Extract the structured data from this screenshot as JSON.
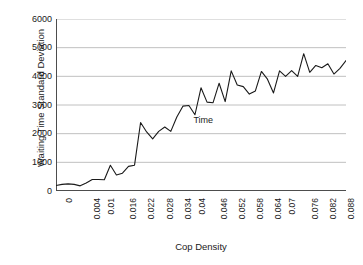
{
  "chart_data": {
    "type": "line",
    "title": "",
    "xlabel": "Cop Density",
    "ylabel": "Waiting Time Standard Deviation",
    "xlim": [
      0,
      0.096
    ],
    "ylim": [
      0,
      6000
    ],
    "grid": true,
    "grid_axis": "y",
    "legend_position": "inline-annotation",
    "annotations": [
      {
        "text": "Time",
        "x": 0.0455,
        "y": 2480
      }
    ],
    "ytick_labels": [
      "0",
      "1000",
      "2000",
      "3000",
      "4000",
      "5000",
      "6000"
    ],
    "ytick_values": [
      0,
      1000,
      2000,
      3000,
      4000,
      5000,
      6000
    ],
    "xtick_labels": [
      "0",
      "0.004",
      "0.01",
      "0.016",
      "0.022",
      "0.028",
      "0.034",
      "0.04",
      "0.046",
      "0.052",
      "0.058",
      "0.064",
      "0.07",
      "0.076",
      "0.082",
      "0.088",
      "0.094"
    ],
    "xtick_values": [
      0,
      0.004,
      0.01,
      0.016,
      0.022,
      0.028,
      0.034,
      0.04,
      0.046,
      0.052,
      0.058,
      0.064,
      0.07,
      0.076,
      0.082,
      0.088,
      0.094
    ],
    "xtick_minor_step": 0.002,
    "series": [
      {
        "name": "Time",
        "color": "#1a1a1a",
        "x": [
          0.0,
          0.002,
          0.004,
          0.006,
          0.008,
          0.01,
          0.012,
          0.014,
          0.016,
          0.018,
          0.02,
          0.022,
          0.024,
          0.026,
          0.028,
          0.03,
          0.032,
          0.034,
          0.036,
          0.038,
          0.04,
          0.042,
          0.044,
          0.046,
          0.048,
          0.05,
          0.052,
          0.054,
          0.056,
          0.058,
          0.06,
          0.062,
          0.064,
          0.066,
          0.068,
          0.07,
          0.072,
          0.074,
          0.076,
          0.078,
          0.08,
          0.082,
          0.084,
          0.086,
          0.088,
          0.09,
          0.092,
          0.094,
          0.096
        ],
        "values": [
          190,
          230,
          250,
          230,
          180,
          280,
          400,
          400,
          390,
          900,
          560,
          620,
          860,
          900,
          2390,
          2060,
          1820,
          2080,
          2230,
          2080,
          2580,
          2960,
          2980,
          2660,
          3600,
          3100,
          3080,
          3760,
          3120,
          4190,
          3700,
          3640,
          3380,
          3490,
          4170,
          3900,
          3420,
          4190,
          4000,
          4200,
          4000,
          4790,
          4140,
          4380,
          4300,
          4440,
          4080,
          4280,
          4550
        ]
      }
    ]
  }
}
